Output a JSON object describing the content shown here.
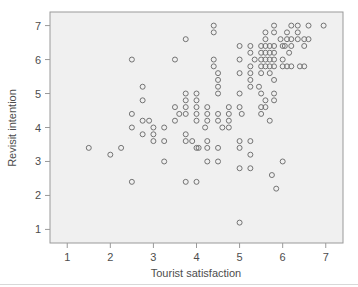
{
  "chart": {
    "background_color": "#f0f0f0",
    "frame_color": "#9a9a9a",
    "marker_color": "#737373",
    "text_color": "#4d4d4d",
    "marker_shape": "open-circle"
  },
  "chart_data": {
    "type": "scatter",
    "title": "",
    "xlabel": "Tourist satisfaction",
    "ylabel": "Revisit intention",
    "xlim": [
      0.6,
      7.4
    ],
    "ylim": [
      0.6,
      7.4
    ],
    "xticks": [
      1,
      2,
      3,
      4,
      5,
      6,
      7
    ],
    "xtick_labels": [
      "1",
      "2",
      "3",
      "4",
      "5",
      "6",
      "7"
    ],
    "yticks": [
      1,
      2,
      3,
      4,
      5,
      6,
      7
    ],
    "ytick_labels": [
      "1",
      "2",
      "3",
      "4",
      "5",
      "6",
      "7"
    ],
    "grid": false,
    "legend": null,
    "n_points": 138,
    "points": [
      [
        1.5,
        3.4
      ],
      [
        2.0,
        3.2
      ],
      [
        2.25,
        3.4
      ],
      [
        2.5,
        6.0
      ],
      [
        2.5,
        4.4
      ],
      [
        2.5,
        4.0
      ],
      [
        2.5,
        2.4
      ],
      [
        2.75,
        5.2
      ],
      [
        2.75,
        4.8
      ],
      [
        2.75,
        4.2
      ],
      [
        2.75,
        3.8
      ],
      [
        3.0,
        4.0
      ],
      [
        3.0,
        3.8
      ],
      [
        3.0,
        3.6
      ],
      [
        3.25,
        4.0
      ],
      [
        3.25,
        3.6
      ],
      [
        3.25,
        3.0
      ],
      [
        3.5,
        6.0
      ],
      [
        3.5,
        4.6
      ],
      [
        3.5,
        4.2
      ],
      [
        3.75,
        6.6
      ],
      [
        3.75,
        5.0
      ],
      [
        3.75,
        4.8
      ],
      [
        3.75,
        4.6
      ],
      [
        3.75,
        4.4
      ],
      [
        3.75,
        3.8
      ],
      [
        3.75,
        3.6
      ],
      [
        3.75,
        2.4
      ],
      [
        4.0,
        5.0
      ],
      [
        4.0,
        4.8
      ],
      [
        4.0,
        4.6
      ],
      [
        4.0,
        4.4
      ],
      [
        4.0,
        4.2
      ],
      [
        4.0,
        3.4
      ],
      [
        4.0,
        2.4
      ],
      [
        4.25,
        4.6
      ],
      [
        4.25,
        4.4
      ],
      [
        4.25,
        4.2
      ],
      [
        4.25,
        3.6
      ],
      [
        4.25,
        3.4
      ],
      [
        4.25,
        3.0
      ],
      [
        4.4,
        7.0
      ],
      [
        4.4,
        6.8
      ],
      [
        4.4,
        6.0
      ],
      [
        4.4,
        5.8
      ],
      [
        4.5,
        5.6
      ],
      [
        4.5,
        5.4
      ],
      [
        4.5,
        5.2
      ],
      [
        4.5,
        5.0
      ],
      [
        4.5,
        4.4
      ],
      [
        4.5,
        4.2
      ],
      [
        4.5,
        3.4
      ],
      [
        4.5,
        3.0
      ],
      [
        4.75,
        4.6
      ],
      [
        4.75,
        4.4
      ],
      [
        4.75,
        4.2
      ],
      [
        4.75,
        4.0
      ],
      [
        5.0,
        6.4
      ],
      [
        5.0,
        6.0
      ],
      [
        5.0,
        5.6
      ],
      [
        5.0,
        5.0
      ],
      [
        5.0,
        4.6
      ],
      [
        5.0,
        3.6
      ],
      [
        5.0,
        3.4
      ],
      [
        5.0,
        2.8
      ],
      [
        5.0,
        1.2
      ],
      [
        5.25,
        6.4
      ],
      [
        5.25,
        6.2
      ],
      [
        5.25,
        5.8
      ],
      [
        5.25,
        5.6
      ],
      [
        5.25,
        5.4
      ],
      [
        5.25,
        5.2
      ],
      [
        5.25,
        3.6
      ],
      [
        5.25,
        3.2
      ],
      [
        5.25,
        2.8
      ],
      [
        5.5,
        6.4
      ],
      [
        5.5,
        6.2
      ],
      [
        5.5,
        6.0
      ],
      [
        5.5,
        5.8
      ],
      [
        5.5,
        5.6
      ],
      [
        5.5,
        5.0
      ],
      [
        5.5,
        4.6
      ],
      [
        5.5,
        4.4
      ],
      [
        5.6,
        6.8
      ],
      [
        5.6,
        6.6
      ],
      [
        5.6,
        6.4
      ],
      [
        5.6,
        6.2
      ],
      [
        5.6,
        6.0
      ],
      [
        5.6,
        5.8
      ],
      [
        5.6,
        4.8
      ],
      [
        5.6,
        4.6
      ],
      [
        5.7,
        6.4
      ],
      [
        5.7,
        6.2
      ],
      [
        5.7,
        6.0
      ],
      [
        5.7,
        5.8
      ],
      [
        5.7,
        5.6
      ],
      [
        5.7,
        4.2
      ],
      [
        5.75,
        2.6
      ],
      [
        5.8,
        7.0
      ],
      [
        5.8,
        6.8
      ],
      [
        5.8,
        6.4
      ],
      [
        5.8,
        6.2
      ],
      [
        5.8,
        6.0
      ],
      [
        5.8,
        5.8
      ],
      [
        5.8,
        5.4
      ],
      [
        5.8,
        5.0
      ],
      [
        5.8,
        4.8
      ],
      [
        5.85,
        2.2
      ],
      [
        6.0,
        6.4
      ],
      [
        6.0,
        6.0
      ],
      [
        6.0,
        5.8
      ],
      [
        6.0,
        3.0
      ],
      [
        6.1,
        6.8
      ],
      [
        6.1,
        6.6
      ],
      [
        6.1,
        5.8
      ],
      [
        6.2,
        7.0
      ],
      [
        6.2,
        6.6
      ],
      [
        6.2,
        6.4
      ],
      [
        6.2,
        5.8
      ],
      [
        6.35,
        7.0
      ],
      [
        6.35,
        6.8
      ],
      [
        6.35,
        6.6
      ],
      [
        6.4,
        5.8
      ],
      [
        6.5,
        6.6
      ],
      [
        6.5,
        6.4
      ],
      [
        6.5,
        5.8
      ],
      [
        6.6,
        7.0
      ],
      [
        6.6,
        6.6
      ],
      [
        6.95,
        7.0
      ],
      [
        4.2,
        4.0
      ],
      [
        4.05,
        3.4
      ],
      [
        3.9,
        3.6
      ],
      [
        5.05,
        4.4
      ],
      [
        5.35,
        6.0
      ],
      [
        5.95,
        6.6
      ],
      [
        6.15,
        6.2
      ],
      [
        4.6,
        4.0
      ],
      [
        3.6,
        4.4
      ],
      [
        2.9,
        4.2
      ],
      [
        5.45,
        5.2
      ],
      [
        6.05,
        6.4
      ]
    ]
  }
}
